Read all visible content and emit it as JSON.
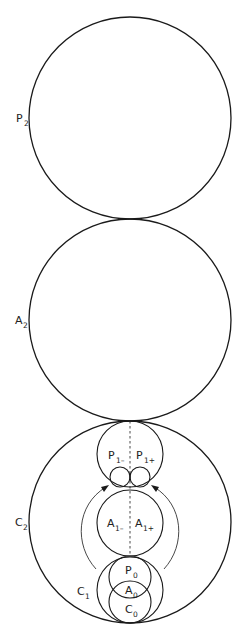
{
  "diagram": {
    "labels": {
      "P2": {
        "main": "P",
        "sub": "2"
      },
      "A2": {
        "main": "A",
        "sub": "2"
      },
      "C2": {
        "main": "C",
        "sub": "2"
      },
      "C1": {
        "main": "C",
        "sub": "1"
      },
      "P1minus": {
        "main": "P",
        "sub": "1–"
      },
      "P1plus": {
        "main": "P",
        "sub": "1+"
      },
      "A1minus": {
        "main": "A",
        "sub": "1–"
      },
      "A1plus": {
        "main": "A",
        "sub": "1+"
      },
      "P0": {
        "main": "P",
        "sub": "0"
      },
      "A0": {
        "main": "A",
        "sub": "0"
      },
      "C0": {
        "main": "C",
        "sub": "0"
      }
    },
    "circles": [
      {
        "id": "P2",
        "cx": 130,
        "cy": 118,
        "r": 101
      },
      {
        "id": "A2",
        "cx": 130,
        "cy": 320,
        "r": 101
      },
      {
        "id": "C2",
        "cx": 130,
        "cy": 522,
        "r": 101
      },
      {
        "id": "P1",
        "cx": 130,
        "cy": 454,
        "r": 33
      },
      {
        "id": "P1-small-left",
        "cx": 120,
        "cy": 477,
        "r": 10
      },
      {
        "id": "P1-small-right",
        "cx": 140,
        "cy": 477,
        "r": 10
      },
      {
        "id": "A1",
        "cx": 130,
        "cy": 523,
        "r": 33
      },
      {
        "id": "C1",
        "cx": 130,
        "cy": 590,
        "r": 33
      },
      {
        "id": "P0",
        "cx": 130,
        "cy": 577,
        "r": 21
      },
      {
        "id": "C0",
        "cx": 130,
        "cy": 602,
        "r": 21
      }
    ],
    "colors": {
      "stroke": "#1a1a1a",
      "background": "#ffffff"
    }
  }
}
